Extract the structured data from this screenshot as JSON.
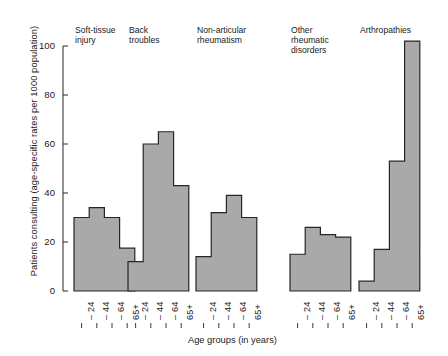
{
  "chart_data": {
    "type": "bar",
    "title": "",
    "xlabel": "Age groups (in years)",
    "ylabel": "Patients consulting (age-specific rates per 1000 population)",
    "ylim": [
      0,
      100
    ],
    "yticks": [
      0,
      20,
      40,
      60,
      80,
      100
    ],
    "grid": false,
    "legend": "none",
    "categories": [
      "– 24",
      "– 44",
      "– 64",
      "65+"
    ],
    "panels": [
      {
        "name": "Soft-tissue\ninjury",
        "values": [
          30,
          34,
          30,
          17.5
        ]
      },
      {
        "name": "Back\ntroubles",
        "values": [
          12,
          60,
          65,
          43
        ]
      },
      {
        "name": "Non-articular\nrheumatism",
        "values": [
          14,
          32,
          39,
          30
        ]
      },
      {
        "name": "Other\nrheumatic\ndisorders",
        "values": [
          15,
          26,
          23,
          22
        ]
      },
      {
        "name": "Arthropathies",
        "values": [
          4,
          17,
          53,
          102
        ]
      }
    ],
    "bar_fill": "#a9a9a9",
    "bar_edge": "#262626",
    "axis_color": "#3a3a3a"
  }
}
